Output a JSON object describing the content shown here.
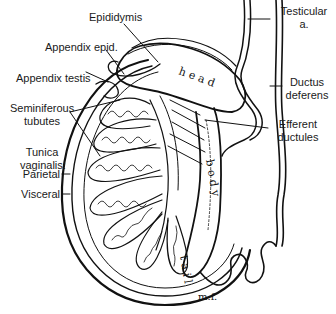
{
  "figure": {
    "labels": {
      "epididymis": "Epididymis",
      "appendix_epid": "Appendix epid.",
      "appendix_testis": "Appendix testis",
      "seminiferous_1": "Seminiferous",
      "seminiferous_2": "tubutes",
      "tunica_1": "Tunica",
      "tunica_2": "vaginalis:",
      "parietal": "Parietal",
      "visceral": "Visceral",
      "testicular_1": "Testicular",
      "testicular_2": "a.",
      "ductus_1": "Ductus",
      "ductus_2": "deferens",
      "efferent_1": "Efferent",
      "efferent_2": "ductules"
    },
    "inline_text": {
      "head": "head",
      "body": "body",
      "tail": "tail",
      "signature": "m.f."
    },
    "colors": {
      "ink": "#111111",
      "background": "#ffffff"
    }
  }
}
